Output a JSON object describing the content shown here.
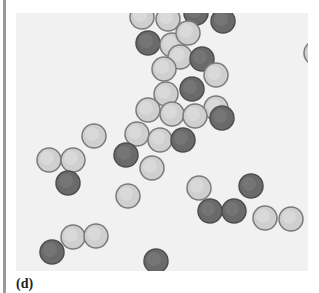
{
  "figure": {
    "caption": "(d)",
    "cell_count": 44,
    "colors": {
      "background": "#f1f1f1",
      "light_cell": "#cfcfcf",
      "dark_cell": "#6a6a6a",
      "cell_rim": "#7a7a7a"
    }
  }
}
